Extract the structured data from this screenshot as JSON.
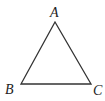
{
  "diagram": {
    "type": "triangle",
    "stroke_color": "#333333",
    "vertices": [
      {
        "label": "A",
        "x": 55,
        "y": 22,
        "label_x": 50,
        "label_y": 17
      },
      {
        "label": "B",
        "x": 21,
        "y": 84,
        "label_x": 5,
        "label_y": 94
      },
      {
        "label": "C",
        "x": 91,
        "y": 84,
        "label_x": 93,
        "label_y": 95
      }
    ]
  }
}
